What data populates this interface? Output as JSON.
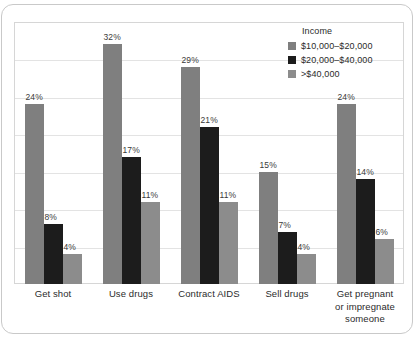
{
  "chart_data": {
    "type": "bar",
    "title": "",
    "subtitle": "",
    "xlabel": "",
    "ylabel": "",
    "ylim": [
      0,
      35
    ],
    "grid": true,
    "grid_interval": 5,
    "axis_tick_labels": [],
    "legend_position": "top-right",
    "legend_title": "Income",
    "categories": [
      "Get shot",
      "Use drugs",
      "Contract AIDS",
      "Sell drugs",
      "Get pregnant or impregnate someone"
    ],
    "series": [
      {
        "name": "$10,000–$20,000",
        "color": "#7f7f7f",
        "values": [
          24,
          32,
          29,
          15,
          24
        ],
        "labels": [
          "24%",
          "32%",
          "29%",
          "15%",
          "24%"
        ]
      },
      {
        "name": "$20,000–$40,000",
        "color": "#1c1c1c",
        "values": [
          8,
          17,
          21,
          7,
          14
        ],
        "labels": [
          "8%",
          "17%",
          "21%",
          "7%",
          "14%"
        ]
      },
      {
        "name": ">$40,000",
        "color": "#8c8c8c",
        "values": [
          4,
          11,
          11,
          4,
          6
        ],
        "labels": [
          "4%",
          "11%",
          "11%",
          "4%",
          "6%"
        ]
      }
    ]
  },
  "categories_display": [
    "Get shot",
    "Use drugs",
    "Contract AIDS",
    "Sell drugs",
    "Get pregnant\nor impregnate\nsomeone"
  ]
}
